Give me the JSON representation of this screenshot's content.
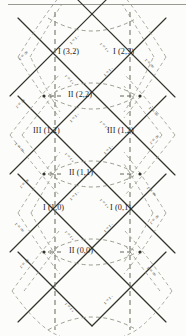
{
  "figure": {
    "type": "penrose-diagram",
    "width": 186,
    "height": 336,
    "background": "#fcfcfa",
    "line_color": "#33332c",
    "dash_color": "#8a8a7e",
    "rule_color": "#9a9a92"
  },
  "symbols": {
    "r_infinity": "r = ∞",
    "r_plus": "r = r",
    "r_plus_sub": "+",
    "r_minus": "r = r",
    "r_minus_sub": "−",
    "r_zero": "r = 0"
  },
  "regions": [
    {
      "id": "r-3-2",
      "label": "I (3,2)",
      "type": "I",
      "x": 62,
      "y": 52
    },
    {
      "id": "r-2-3",
      "label": "I (2,3)",
      "type": "I",
      "x": 117,
      "y": 52
    },
    {
      "id": "r-2-2",
      "label": "II (2,2)",
      "type": "II",
      "x": 71,
      "y": 91
    },
    {
      "id": "r-1-2l",
      "label": "III (1,2)",
      "type": "III",
      "x": 39,
      "y": 131
    },
    {
      "id": "r-1-2r",
      "label": "III (1,2)",
      "type": "III",
      "x": 113,
      "y": 131
    },
    {
      "id": "r-1-1",
      "label": "II (1,1)",
      "type": "II",
      "x": 71,
      "y": 168
    },
    {
      "id": "r-1-0",
      "label": "I (1,0)",
      "type": "I",
      "x": 48,
      "y": 208
    },
    {
      "id": "r-0-1",
      "label": "I (0,1)",
      "type": "I",
      "x": 114,
      "y": 208
    },
    {
      "id": "r-0-0",
      "label": "II (0,0)",
      "type": "II",
      "x": 71,
      "y": 250
    }
  ],
  "edge_labels": [
    {
      "id": "inf-tl-1",
      "text": "r = ∞",
      "x": 24,
      "y": 104,
      "rot": -45
    },
    {
      "id": "inf-bl-1",
      "text": "r = ∞",
      "x": 24,
      "y": 146,
      "rot": 45
    },
    {
      "id": "inf-tl-2",
      "text": "r = ∞",
      "x": 24,
      "y": 186,
      "rot": -45
    },
    {
      "id": "inf-bl-2",
      "text": "r = ∞",
      "x": 24,
      "y": 228,
      "rot": 45
    },
    {
      "id": "inf-tl-3",
      "text": "r = ∞",
      "x": 24,
      "y": 267,
      "rot": -45
    },
    {
      "id": "inf-tr-1",
      "text": "r = ∞",
      "x": 150,
      "y": 104,
      "rot": 45
    },
    {
      "id": "inf-br-1",
      "text": "r = ∞",
      "x": 150,
      "y": 146,
      "rot": -45
    },
    {
      "id": "inf-tr-2",
      "text": "r = ∞",
      "x": 150,
      "y": 186,
      "rot": 45
    },
    {
      "id": "inf-br-2",
      "text": "r = ∞",
      "x": 150,
      "y": 228,
      "rot": -45
    },
    {
      "id": "inf-tr-3",
      "text": "r = ∞",
      "x": 150,
      "y": 267,
      "rot": 45
    },
    {
      "id": "inf-tl-0",
      "text": "r = ∞",
      "x": 150,
      "y": 58,
      "rot": 45
    },
    {
      "id": "inf-tr-0",
      "text": "r = ∞",
      "x": 28,
      "y": 58,
      "rot": -45
    }
  ],
  "horizon_labels": [
    {
      "id": "rp-1",
      "text": "r = r₊",
      "x": 72,
      "y": 70,
      "rot": 45
    },
    {
      "id": "rm-1",
      "text": "r = r₋",
      "x": 104,
      "y": 70,
      "rot": -45
    },
    {
      "id": "rm-2",
      "text": "r = r₋",
      "x": 74,
      "y": 42,
      "rot": -45
    },
    {
      "id": "rp-2",
      "text": "r = r₊",
      "x": 104,
      "y": 42,
      "rot": 45
    },
    {
      "id": "rp-3",
      "text": "r = r₊",
      "x": 72,
      "y": 148,
      "rot": 45
    },
    {
      "id": "rm-3",
      "text": "r = r₋",
      "x": 104,
      "y": 148,
      "rot": -45
    },
    {
      "id": "rm-4",
      "text": "r = r₋",
      "x": 72,
      "y": 118,
      "rot": -45
    },
    {
      "id": "rp-4",
      "text": "r = r₊",
      "x": 104,
      "y": 118,
      "rot": 45
    },
    {
      "id": "rp-5",
      "text": "r = r₊",
      "x": 72,
      "y": 228,
      "rot": 45
    },
    {
      "id": "rm-5",
      "text": "r = r₋",
      "x": 104,
      "y": 228,
      "rot": -45
    },
    {
      "id": "rm-6",
      "text": "r = r₋",
      "x": 72,
      "y": 196,
      "rot": -45
    },
    {
      "id": "rp-6",
      "text": "r = r₊",
      "x": 104,
      "y": 196,
      "rot": 45
    },
    {
      "id": "rp-7",
      "text": "r = r₊",
      "x": 72,
      "y": 300,
      "rot": 45
    },
    {
      "id": "rm-7",
      "text": "r = r₋",
      "x": 104,
      "y": 300,
      "rot": -45
    }
  ],
  "geometry": {
    "left_x": 44,
    "right_x": 140,
    "outer_left_x": 18,
    "outer_right_x": 166,
    "node_ys": [
      18,
      96,
      174,
      252,
      330
    ],
    "vertical_dashed_x": [
      55,
      130
    ],
    "center_x": 92
  }
}
